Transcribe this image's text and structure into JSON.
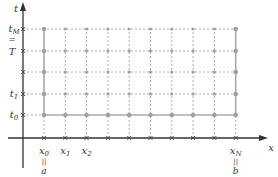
{
  "diagram": {
    "type": "finite-difference grid",
    "axes": {
      "x_label": "x",
      "y_label": "t"
    },
    "x_ticks": {
      "count": 10,
      "labels": [
        {
          "index": 0,
          "text": "x",
          "sub": "0",
          "eq": "a"
        },
        {
          "index": 1,
          "text": "x",
          "sub": "1"
        },
        {
          "index": 2,
          "text": "x",
          "sub": "2"
        },
        {
          "index": 9,
          "text": "x",
          "sub": "N",
          "eq": "b"
        }
      ]
    },
    "t_ticks": {
      "count": 5,
      "labels": [
        {
          "index": 0,
          "text": "t",
          "sub": "0"
        },
        {
          "index": 1,
          "text": "t",
          "sub": "1"
        },
        {
          "index": 3,
          "text": "T"
        },
        {
          "index": 4,
          "text": "t",
          "sub": "M",
          "eq": "T"
        }
      ]
    },
    "equals_sign": "||",
    "colors": {
      "axis": "#333333",
      "grid": "#999999",
      "node": "#a0a0a0",
      "boundary": "#aaaaaa"
    }
  }
}
